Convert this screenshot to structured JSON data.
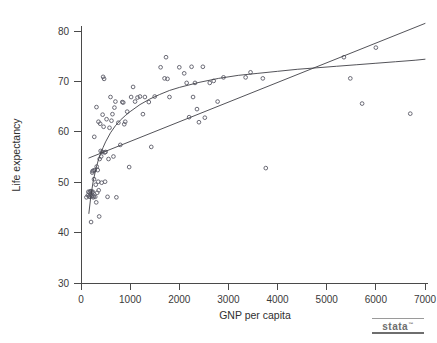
{
  "chart_data": {
    "type": "scatter",
    "title": "",
    "xlabel": "GNP per capita",
    "ylabel": "Life expectancy",
    "xlim": [
      0,
      7000
    ],
    "ylim": [
      30,
      83
    ],
    "xticks": [
      0,
      1000,
      2000,
      3000,
      4000,
      5000,
      6000,
      7000
    ],
    "yticks": [
      30,
      40,
      50,
      60,
      70,
      80
    ],
    "xtick_labels": [
      "0",
      "1000",
      "2000",
      "3000",
      "4000",
      "5000",
      "6000",
      "7000"
    ],
    "ytick_labels": [
      "30",
      "40",
      "50",
      "60",
      "70",
      "80"
    ],
    "grid": false,
    "legend": "none",
    "marker": "open-circle",
    "marker_color": "#5a5a66",
    "line_color": "#3f3f46",
    "points": [
      [
        110,
        47.0
      ],
      [
        140,
        47.4
      ],
      [
        150,
        48.1
      ],
      [
        165,
        47.2
      ],
      [
        175,
        48.0
      ],
      [
        180,
        47.1
      ],
      [
        190,
        48.2
      ],
      [
        200,
        47.5
      ],
      [
        205,
        42.1
      ],
      [
        210,
        48.2
      ],
      [
        215,
        47.2
      ],
      [
        225,
        47.9
      ],
      [
        230,
        51.9
      ],
      [
        235,
        52.2
      ],
      [
        240,
        48.1
      ],
      [
        250,
        47.0
      ],
      [
        255,
        52.3
      ],
      [
        260,
        47.2
      ],
      [
        265,
        50.6
      ],
      [
        270,
        59.0
      ],
      [
        280,
        52.4
      ],
      [
        290,
        47.1
      ],
      [
        300,
        49.5
      ],
      [
        310,
        46.0
      ],
      [
        315,
        64.9
      ],
      [
        320,
        53.1
      ],
      [
        330,
        47.9
      ],
      [
        340,
        52.4
      ],
      [
        350,
        50.1
      ],
      [
        355,
        62.0
      ],
      [
        360,
        48.4
      ],
      [
        370,
        43.2
      ],
      [
        380,
        54.6
      ],
      [
        390,
        61.6
      ],
      [
        400,
        56.2
      ],
      [
        410,
        55.1
      ],
      [
        420,
        49.9
      ],
      [
        430,
        56.0
      ],
      [
        440,
        63.4
      ],
      [
        450,
        70.9
      ],
      [
        460,
        61.0
      ],
      [
        470,
        70.5
      ],
      [
        480,
        55.9
      ],
      [
        490,
        50.1
      ],
      [
        500,
        56.0
      ],
      [
        520,
        62.5
      ],
      [
        540,
        47.1
      ],
      [
        560,
        54.6
      ],
      [
        580,
        60.8
      ],
      [
        600,
        66.9
      ],
      [
        620,
        62.2
      ],
      [
        640,
        63.5
      ],
      [
        660,
        55.1
      ],
      [
        680,
        64.8
      ],
      [
        700,
        66.0
      ],
      [
        720,
        47.0
      ],
      [
        760,
        61.8
      ],
      [
        800,
        57.4
      ],
      [
        840,
        65.9
      ],
      [
        860,
        65.8
      ],
      [
        880,
        61.5
      ],
      [
        900,
        62.0
      ],
      [
        940,
        64.0
      ],
      [
        980,
        53.0
      ],
      [
        1020,
        66.9
      ],
      [
        1060,
        68.9
      ],
      [
        1100,
        66.0
      ],
      [
        1150,
        66.8
      ],
      [
        1200,
        67.0
      ],
      [
        1260,
        63.5
      ],
      [
        1300,
        66.9
      ],
      [
        1380,
        65.9
      ],
      [
        1430,
        57.0
      ],
      [
        1500,
        67.0
      ],
      [
        1620,
        72.8
      ],
      [
        1700,
        70.6
      ],
      [
        1730,
        74.8
      ],
      [
        1760,
        70.5
      ],
      [
        1800,
        66.9
      ],
      [
        2000,
        72.8
      ],
      [
        2100,
        71.6
      ],
      [
        2150,
        69.7
      ],
      [
        2200,
        62.9
      ],
      [
        2250,
        72.9
      ],
      [
        2280,
        66.9
      ],
      [
        2320,
        69.7
      ],
      [
        2360,
        64.5
      ],
      [
        2400,
        61.9
      ],
      [
        2480,
        72.9
      ],
      [
        2520,
        62.8
      ],
      [
        2620,
        69.7
      ],
      [
        2700,
        70.1
      ],
      [
        2780,
        66.0
      ],
      [
        2900,
        70.8
      ],
      [
        3350,
        70.8
      ],
      [
        3450,
        71.8
      ],
      [
        3700,
        70.6
      ],
      [
        3760,
        52.8
      ],
      [
        5350,
        74.8
      ],
      [
        5480,
        70.6
      ],
      [
        5720,
        65.6
      ],
      [
        6000,
        76.7
      ],
      [
        6700,
        63.6
      ]
    ],
    "curves": [
      {
        "name": "log-fit-curve",
        "shape": "logarithmic",
        "x": [
          160,
          200,
          250,
          300,
          350,
          400,
          450,
          500,
          600,
          700,
          800,
          900,
          1000,
          1200,
          1400,
          1600,
          1800,
          2000,
          2400,
          2800,
          3200,
          3600,
          4000,
          4400,
          4800,
          5200,
          5600,
          6000,
          6400,
          6800,
          7000
        ],
        "y": [
          43.8,
          47.2,
          50.3,
          52.5,
          54.3,
          55.7,
          56.9,
          58.0,
          59.8,
          61.2,
          62.3,
          63.2,
          64.0,
          65.4,
          66.5,
          67.4,
          68.2,
          68.8,
          69.8,
          70.6,
          71.2,
          71.6,
          72.0,
          72.4,
          72.7,
          73.0,
          73.3,
          73.6,
          73.9,
          74.2,
          74.4
        ]
      },
      {
        "name": "linear-fit-line",
        "shape": "linear",
        "x": [
          160,
          7000
        ],
        "y": [
          54.8,
          81.5
        ]
      }
    ]
  },
  "branding": {
    "logo_text": "stata",
    "logo_tm": "™"
  }
}
